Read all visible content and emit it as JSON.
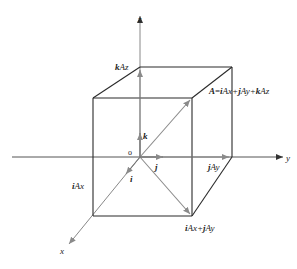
{
  "diagram": {
    "colors": {
      "cube": "#2a2a2a",
      "vector": "#8a8a8a",
      "axis": "#555555",
      "text": "#222222"
    },
    "axes": {
      "x": {
        "label": "x"
      },
      "y": {
        "label": "y"
      },
      "z": {
        "label": "z"
      },
      "origin": {
        "label": "o"
      }
    },
    "unit_vectors": {
      "i": "i",
      "j": "j",
      "k": "k"
    },
    "labels": {
      "kAz": {
        "unit": "k",
        "rest": "Az"
      },
      "jAy": {
        "unit": "j",
        "rest": "Ay"
      },
      "iAx": {
        "unit": "i",
        "rest": "Ax"
      },
      "iAx_jAy": {
        "u1": "i",
        "r1": "Ax+",
        "u2": "j",
        "r2": "Ay"
      },
      "A_eq": {
        "A": "A",
        "eq": "=",
        "u1": "i",
        "r1": "Ax+",
        "u2": "j",
        "r2": "Ay+",
        "u3": "k",
        "r3": "Az"
      }
    }
  }
}
